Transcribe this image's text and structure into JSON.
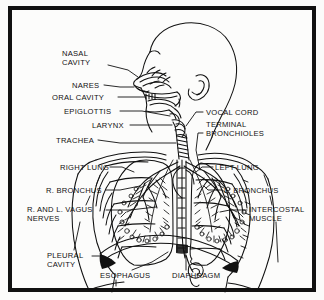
{
  "figure": {
    "kind": "anatomical-line-diagram",
    "colors": {
      "ink": "#111111",
      "paper": "#fcfcfb",
      "frame": "#111111"
    }
  },
  "labels": [
    {
      "id": "nasal-cavity",
      "lines": [
        "NASAL",
        "CAVITY"
      ],
      "x": 62,
      "y": 49,
      "align": "left"
    },
    {
      "id": "nares",
      "lines": [
        "NARES"
      ],
      "x": 72,
      "y": 83,
      "align": "left"
    },
    {
      "id": "oral-cavity",
      "lines": [
        "ORAL CAVITY"
      ],
      "x": 55,
      "y": 96,
      "align": "left"
    },
    {
      "id": "epiglottis",
      "lines": [
        "EPIGLOTTIS"
      ],
      "x": 68,
      "y": 110,
      "align": "left"
    },
    {
      "id": "larynx",
      "lines": [
        "LARYNX"
      ],
      "x": 100,
      "y": 124,
      "align": "left"
    },
    {
      "id": "trachea",
      "lines": [
        "TRACHEA"
      ],
      "x": 58,
      "y": 138,
      "align": "left"
    },
    {
      "id": "vocal-cord",
      "lines": [
        "VOCAL CORD"
      ],
      "x": 205,
      "y": 110,
      "align": "left"
    },
    {
      "id": "terminal-bronchioles",
      "lines": [
        "TERMINAL",
        "BRONCHIOLES"
      ],
      "x": 205,
      "y": 123,
      "align": "left"
    },
    {
      "id": "right-lung",
      "lines": [
        "RIGHT LUNG"
      ],
      "x": 60,
      "y": 164,
      "align": "left"
    },
    {
      "id": "left-lung",
      "lines": [
        "LEFT LUNG"
      ],
      "x": 215,
      "y": 164,
      "align": "left"
    },
    {
      "id": "r-bronchus",
      "lines": [
        "R. BRONCHUS"
      ],
      "x": 47,
      "y": 188,
      "align": "left"
    },
    {
      "id": "l-bronchus",
      "lines": [
        "L. BRONCHUS"
      ],
      "x": 224,
      "y": 188,
      "align": "left"
    },
    {
      "id": "vagus-nerves",
      "lines": [
        "R. AND L. VAGUS",
        "NERVES"
      ],
      "x": 29,
      "y": 207,
      "align": "left"
    },
    {
      "id": "intercostal-muscle",
      "lines": [
        "INTERCOSTAL",
        "MUSCLE"
      ],
      "x": 249,
      "y": 207,
      "align": "left"
    },
    {
      "id": "pleural-cavity",
      "lines": [
        "PLEURAL",
        "CAVITY"
      ],
      "x": 48,
      "y": 253,
      "align": "left"
    },
    {
      "id": "esophagus",
      "lines": [
        "ESOPHAGUS"
      ],
      "x": 102,
      "y": 273,
      "align": "left"
    },
    {
      "id": "diaphragm",
      "lines": [
        "DIAPHRAGM"
      ],
      "x": 174,
      "y": 273,
      "align": "left"
    }
  ]
}
